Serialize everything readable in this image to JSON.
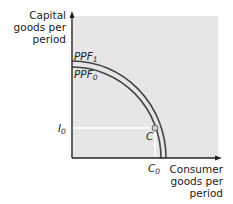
{
  "diagram": {
    "type": "production-possibility-frontier",
    "background_color": "#e6e6e6",
    "curve_color": "#444444",
    "axes": {
      "y_label": "Capital goods per period",
      "x_label": "Consumer goods per period"
    },
    "curves": [
      {
        "name": "PPF",
        "subscript": "1"
      },
      {
        "name": "PPF",
        "subscript": "0"
      }
    ],
    "point": {
      "label": "C"
    },
    "y_marker": {
      "name": "I",
      "subscript": "0"
    },
    "x_marker": {
      "name": "C",
      "subscript": "0"
    }
  }
}
